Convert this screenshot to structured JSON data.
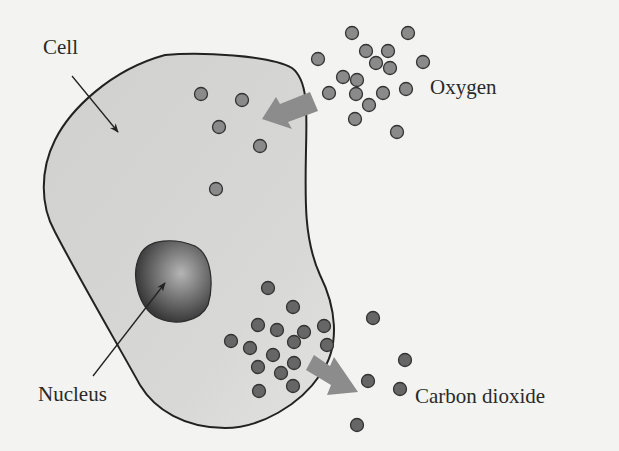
{
  "diagram": {
    "labels": {
      "cell": "Cell",
      "nucleus": "Nucleus",
      "oxygen": "Oxygen",
      "carbon_dioxide": "Carbon dioxide"
    },
    "colors": {
      "background": "#f3f3f1",
      "cell_fill": "#d2d2d0",
      "cell_outline": "#222222",
      "oxygen_dot": "#8a8a8a",
      "co2_dot": "#666666",
      "arrow": "#8c8c8c",
      "nucleus_dark": "#3a3a3a",
      "nucleus_light": "#b5b5b5"
    },
    "oxygen_molecules": {
      "outside": [
        [
          352,
          33
        ],
        [
          408,
          33
        ],
        [
          366,
          51
        ],
        [
          388,
          51
        ],
        [
          318,
          59
        ],
        [
          376,
          63
        ],
        [
          390,
          68
        ],
        [
          423,
          62
        ],
        [
          343,
          77
        ],
        [
          357,
          80
        ],
        [
          329,
          93
        ],
        [
          356,
          94
        ],
        [
          383,
          93
        ],
        [
          406,
          89
        ],
        [
          369,
          105
        ],
        [
          355,
          119
        ],
        [
          397,
          132
        ]
      ],
      "inside": [
        [
          201,
          94
        ],
        [
          242,
          100
        ],
        [
          219,
          127
        ],
        [
          260,
          146
        ],
        [
          216,
          189
        ]
      ]
    },
    "co2_molecules": {
      "inside": [
        [
          268,
          288
        ],
        [
          293,
          307
        ],
        [
          258,
          325
        ],
        [
          277,
          330
        ],
        [
          304,
          332
        ],
        [
          324,
          326
        ],
        [
          231,
          341
        ],
        [
          250,
          348
        ],
        [
          294,
          342
        ],
        [
          327,
          345
        ],
        [
          273,
          355
        ],
        [
          258,
          367
        ],
        [
          294,
          363
        ],
        [
          281,
          373
        ],
        [
          259,
          391
        ],
        [
          293,
          386
        ]
      ],
      "outside": [
        [
          373,
          318
        ],
        [
          405,
          360
        ],
        [
          368,
          381
        ],
        [
          400,
          389
        ],
        [
          357,
          425
        ]
      ]
    },
    "arrows": {
      "oxygen_in": "outside-to-inside",
      "co2_out": "inside-to-outside"
    }
  }
}
